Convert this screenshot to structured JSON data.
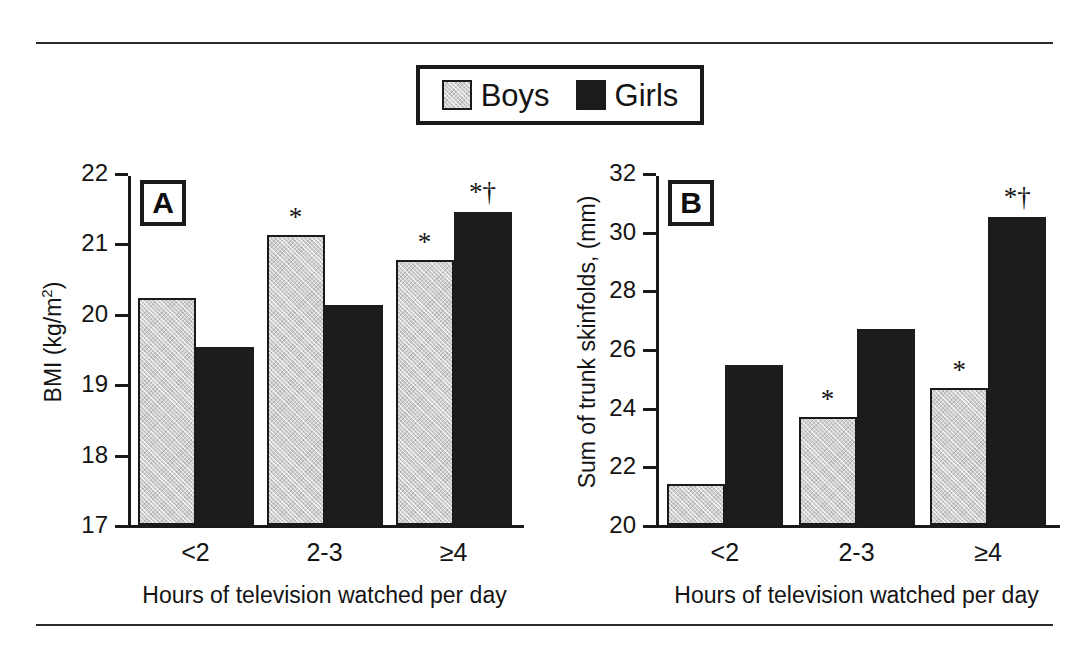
{
  "legend": {
    "entries": [
      {
        "label": "Boys",
        "color": "#cfcfcf",
        "swatch": "boys-swatch"
      },
      {
        "label": "Girls",
        "color": "#1c1c1c",
        "swatch": "girls-swatch"
      }
    ]
  },
  "panels": [
    {
      "letter": "A",
      "ylabel_main": "BMI (kg/m",
      "ylabel_sup": "2",
      "ylabel_tail": ")",
      "xlabel": "Hours of television watched per day",
      "ticks": [
        "22",
        "21",
        "20",
        "19",
        "18",
        "17"
      ],
      "categories": [
        "<2",
        "2-3",
        "≥4"
      ],
      "sig": {
        "boys": [
          "",
          "*",
          "*"
        ],
        "girls": [
          "",
          "",
          "*†"
        ]
      }
    },
    {
      "letter": "B",
      "ylabel_main": "Sum of trunk skinfolds, (mm)",
      "ylabel_sup": "",
      "ylabel_tail": "",
      "xlabel": "Hours of television watched per day",
      "ticks": [
        "32",
        "30",
        "28",
        "26",
        "24",
        "22",
        "20"
      ],
      "categories": [
        "<2",
        "2-3",
        "≥4"
      ],
      "sig": {
        "boys": [
          "",
          "*",
          "*"
        ],
        "girls": [
          "",
          "",
          "*†"
        ]
      }
    }
  ],
  "chart_data": [
    {
      "type": "bar",
      "title": "A",
      "categories": [
        "<2",
        "2-3",
        "≥4"
      ],
      "series": [
        {
          "name": "Boys",
          "values": [
            20.25,
            21.15,
            20.8
          ]
        },
        {
          "name": "Girls",
          "values": [
            19.55,
            20.15,
            21.48
          ]
        }
      ],
      "xlabel": "Hours of television watched per day",
      "ylabel": "BMI (kg/m2)",
      "ylim": [
        17,
        22
      ],
      "ytick_step": 1,
      "grid": false,
      "legend_position": "top-center",
      "annotations": [
        {
          "series": "Boys",
          "category": "2-3",
          "text": "*"
        },
        {
          "series": "Boys",
          "category": "≥4",
          "text": "*"
        },
        {
          "series": "Girls",
          "category": "≥4",
          "text": "*†"
        }
      ]
    },
    {
      "type": "bar",
      "title": "B",
      "categories": [
        "<2",
        "2-3",
        "≥4"
      ],
      "series": [
        {
          "name": "Boys",
          "values": [
            21.4,
            23.7,
            24.7
          ]
        },
        {
          "name": "Girls",
          "values": [
            25.5,
            26.75,
            30.6
          ]
        }
      ],
      "xlabel": "Hours of television watched per day",
      "ylabel": "Sum of trunk skinfolds, (mm)",
      "ylim": [
        20,
        32
      ],
      "ytick_step": 2,
      "grid": false,
      "legend_position": "top-center",
      "annotations": [
        {
          "series": "Boys",
          "category": "2-3",
          "text": "*"
        },
        {
          "series": "Boys",
          "category": "≥4",
          "text": "*"
        },
        {
          "series": "Girls",
          "category": "≥4",
          "text": "*†"
        }
      ]
    }
  ]
}
